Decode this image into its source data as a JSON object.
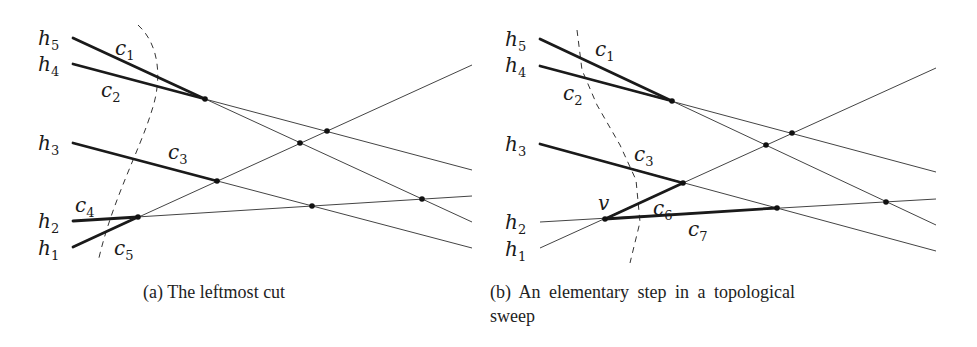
{
  "figure": {
    "panels": [
      {
        "id": "a",
        "caption": "(a) The leftmost cut",
        "line_labels": [
          {
            "name": "h",
            "sub": "5",
            "x": 38,
            "y": 45
          },
          {
            "name": "h",
            "sub": "4",
            "x": 38,
            "y": 71
          },
          {
            "name": "h",
            "sub": "3",
            "x": 38,
            "y": 150
          },
          {
            "name": "h",
            "sub": "2",
            "x": 38,
            "y": 228
          },
          {
            "name": "h",
            "sub": "1",
            "x": 38,
            "y": 255
          }
        ],
        "cut_labels": [
          {
            "name": "c",
            "sub": "1",
            "x": 115,
            "y": 55
          },
          {
            "name": "c",
            "sub": "2",
            "x": 101,
            "y": 97
          },
          {
            "name": "c",
            "sub": "3",
            "x": 168,
            "y": 159
          },
          {
            "name": "c",
            "sub": "4",
            "x": 75,
            "y": 212
          },
          {
            "name": "c",
            "sub": "5",
            "x": 114,
            "y": 255
          }
        ],
        "lines": [
          {
            "id": "h5",
            "x1": 73,
            "y1": 38,
            "x2": 472,
            "y2": 222
          },
          {
            "id": "h4",
            "x1": 73,
            "y1": 64,
            "x2": 472,
            "y2": 170
          },
          {
            "id": "h3",
            "x1": 73,
            "y1": 143,
            "x2": 472,
            "y2": 248
          },
          {
            "id": "h2",
            "x1": 73,
            "y1": 221,
            "x2": 472,
            "y2": 196
          },
          {
            "id": "h1",
            "x1": 73,
            "y1": 247,
            "x2": 472,
            "y2": 65
          }
        ],
        "bold_segments": [
          {
            "x1": 73,
            "y1": 38,
            "x2": 205,
            "y2": 99
          },
          {
            "x1": 73,
            "y1": 64,
            "x2": 205,
            "y2": 99
          },
          {
            "x1": 73,
            "y1": 143,
            "x2": 217,
            "y2": 181
          },
          {
            "x1": 73,
            "y1": 221,
            "x2": 138,
            "y2": 217
          },
          {
            "x1": 73,
            "y1": 247,
            "x2": 138,
            "y2": 217
          }
        ],
        "vertices": [
          {
            "x": 205,
            "y": 99
          },
          {
            "x": 138,
            "y": 217
          },
          {
            "x": 217,
            "y": 181
          },
          {
            "x": 300,
            "y": 143
          },
          {
            "x": 327,
            "y": 131
          },
          {
            "x": 312,
            "y": 206
          },
          {
            "x": 422,
            "y": 199
          }
        ],
        "cut_path": "M138,25 C160,45 162,80 152,110 C140,150 112,200 98,262"
      },
      {
        "id": "b",
        "caption_line1": "(b) An elementary step in a topological",
        "caption_line2": "sweep",
        "line_labels": [
          {
            "name": "h",
            "sub": "5",
            "x": 505,
            "y": 46
          },
          {
            "name": "h",
            "sub": "4",
            "x": 505,
            "y": 72
          },
          {
            "name": "h",
            "sub": "3",
            "x": 505,
            "y": 151
          },
          {
            "name": "h",
            "sub": "2",
            "x": 505,
            "y": 229
          },
          {
            "name": "h",
            "sub": "1",
            "x": 505,
            "y": 256
          }
        ],
        "cut_labels": [
          {
            "name": "c",
            "sub": "1",
            "x": 595,
            "y": 56
          },
          {
            "name": "c",
            "sub": "2",
            "x": 563,
            "y": 100
          },
          {
            "name": "c",
            "sub": "3",
            "x": 634,
            "y": 161
          },
          {
            "name": "c",
            "sub": "6",
            "x": 653,
            "y": 215
          },
          {
            "name": "c",
            "sub": "7",
            "x": 688,
            "y": 236
          }
        ],
        "vertex_label": {
          "text": "v",
          "x": 598,
          "y": 210
        },
        "lines": [
          {
            "id": "h5",
            "x1": 540,
            "y1": 39,
            "x2": 936,
            "y2": 225
          },
          {
            "id": "h4",
            "x1": 540,
            "y1": 66,
            "x2": 936,
            "y2": 172
          },
          {
            "id": "h3",
            "x1": 540,
            "y1": 144,
            "x2": 936,
            "y2": 251
          },
          {
            "id": "h2",
            "x1": 540,
            "y1": 222,
            "x2": 936,
            "y2": 199
          },
          {
            "id": "h1",
            "x1": 540,
            "y1": 248,
            "x2": 936,
            "y2": 68
          }
        ],
        "bold_segments": [
          {
            "x1": 540,
            "y1": 39,
            "x2": 672,
            "y2": 101
          },
          {
            "x1": 540,
            "y1": 66,
            "x2": 672,
            "y2": 101
          },
          {
            "x1": 540,
            "y1": 144,
            "x2": 683,
            "y2": 183
          },
          {
            "x1": 605,
            "y1": 219,
            "x2": 683,
            "y2": 183
          },
          {
            "x1": 605,
            "y1": 219,
            "x2": 777,
            "y2": 208
          }
        ],
        "vertices": [
          {
            "x": 672,
            "y": 101
          },
          {
            "x": 605,
            "y": 219
          },
          {
            "x": 683,
            "y": 183
          },
          {
            "x": 766,
            "y": 145
          },
          {
            "x": 792,
            "y": 133
          },
          {
            "x": 777,
            "y": 208
          },
          {
            "x": 886,
            "y": 202
          }
        ],
        "cut_path": "M577,30 L582,70 L597,105 L620,145 L636,180 L640,222 L630,263"
      }
    ]
  }
}
